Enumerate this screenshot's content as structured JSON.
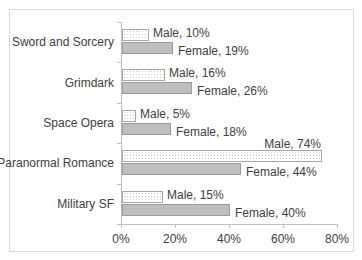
{
  "chart_data": {
    "type": "bar",
    "orientation": "horizontal",
    "title": "",
    "xlabel": "",
    "ylabel": "",
    "categories": [
      "Sword and Sorcery",
      "Grimdark",
      "Space Opera",
      "Paranormal Romance",
      "Military SF"
    ],
    "series": [
      {
        "name": "Male",
        "values": [
          10,
          16,
          5,
          74,
          15
        ],
        "color": "#ffffff",
        "pattern": "dotted"
      },
      {
        "name": "Female",
        "values": [
          19,
          26,
          18,
          44,
          40
        ],
        "color": "#c8c8c8",
        "pattern": "fine-dotted"
      }
    ],
    "data_labels": {
      "male": [
        "Male, 10%",
        "Male, 16%",
        "Male, 5%",
        "Male, 74%",
        "Male, 15%"
      ],
      "female": [
        "Female, 19%",
        "Female, 26%",
        "Female, 18%",
        "Female, 44%",
        "Female, 40%"
      ]
    },
    "x_ticks": [
      "0%",
      "20%",
      "40%",
      "60%",
      "80%"
    ],
    "xlim": [
      0,
      80
    ],
    "grid": false,
    "legend": "none"
  }
}
